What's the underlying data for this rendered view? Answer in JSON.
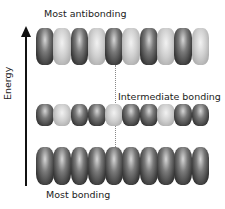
{
  "labels": {
    "top": "Most antibonding",
    "middle": "Intermediate bonding",
    "bottom": "Most bonding",
    "axis": "Energy"
  },
  "rows": {
    "top": [
      "dark",
      "light",
      "dark",
      "light",
      "dark",
      "light",
      "dark",
      "light",
      "dark",
      "light"
    ],
    "middle": [
      "dark",
      "light",
      "dark",
      "dark",
      "light",
      "dark",
      "dark",
      "light",
      "dark",
      "dark"
    ],
    "bottom": [
      "dark",
      "dark",
      "dark",
      "dark",
      "dark",
      "dark",
      "dark",
      "dark",
      "dark",
      "dark"
    ]
  },
  "colors": {
    "dark_phase": "#3a3a3a",
    "light_phase": "#cfcfcf",
    "axis": "#111111"
  }
}
